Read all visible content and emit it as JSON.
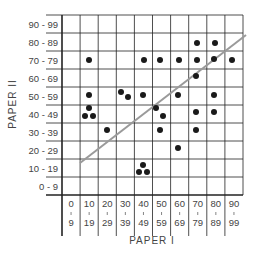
{
  "chart_data": {
    "type": "scatter",
    "title": "",
    "xlabel": "PAPER I",
    "ylabel": "PAPER II",
    "x_categories": [
      "0-9",
      "10-19",
      "20-29",
      "30-39",
      "40-49",
      "50-59",
      "60-69",
      "70-79",
      "80-89",
      "90-99"
    ],
    "x_tick_labels": [
      {
        "top": "0",
        "bottom": "9"
      },
      {
        "top": "10",
        "bottom": "19"
      },
      {
        "top": "20",
        "bottom": "29"
      },
      {
        "top": "30",
        "bottom": "39"
      },
      {
        "top": "40",
        "bottom": "49"
      },
      {
        "top": "50",
        "bottom": "59"
      },
      {
        "top": "60",
        "bottom": "69"
      },
      {
        "top": "70",
        "bottom": "79"
      },
      {
        "top": "80",
        "bottom": "89"
      },
      {
        "top": "90",
        "bottom": "99"
      }
    ],
    "y_categories": [
      "0 - 9",
      "10 - 19",
      "20 - 29",
      "30 - 39",
      "40 - 49",
      "50 - 59",
      "60 - 69",
      "70 - 79",
      "80 - 89",
      "90 - 99"
    ],
    "grid": true,
    "legend": "none",
    "points": [
      {
        "paper_I": "10-19",
        "paper_II": "70-79",
        "px": 89,
        "py": 60
      },
      {
        "paper_I": "10-19",
        "paper_II": "50-59",
        "px": 89,
        "py": 95
      },
      {
        "paper_I": "10-19",
        "paper_II": "40-49",
        "px": 89,
        "py": 108
      },
      {
        "paper_I": "10-19",
        "paper_II": "40-49",
        "px": 85,
        "py": 116
      },
      {
        "paper_I": "10-19",
        "paper_II": "40-49",
        "px": 93,
        "py": 116
      },
      {
        "paper_I": "20-29",
        "paper_II": "30-39",
        "px": 107,
        "py": 130
      },
      {
        "paper_I": "30-39",
        "paper_II": "50-59",
        "px": 121,
        "py": 92
      },
      {
        "paper_I": "30-39",
        "paper_II": "50-59",
        "px": 128,
        "py": 97
      },
      {
        "paper_I": "40-49",
        "paper_II": "70-79",
        "px": 144,
        "py": 60
      },
      {
        "paper_I": "40-49",
        "paper_II": "50-59",
        "px": 143,
        "py": 95
      },
      {
        "paper_I": "40-49",
        "paper_II": "10-19",
        "px": 143,
        "py": 165
      },
      {
        "paper_I": "40-49",
        "paper_II": "10-19",
        "px": 139,
        "py": 172
      },
      {
        "paper_I": "40-49",
        "paper_II": "10-19",
        "px": 147,
        "py": 172
      },
      {
        "paper_I": "50-59",
        "paper_II": "70-79",
        "px": 160,
        "py": 60
      },
      {
        "paper_I": "50-59",
        "paper_II": "40-49",
        "px": 156,
        "py": 108
      },
      {
        "paper_I": "50-59",
        "paper_II": "40-49",
        "px": 163,
        "py": 116
      },
      {
        "paper_I": "50-59",
        "paper_II": "30-39",
        "px": 160,
        "py": 130
      },
      {
        "paper_I": "60-69",
        "paper_II": "70-79",
        "px": 179,
        "py": 60
      },
      {
        "paper_I": "60-69",
        "paper_II": "50-59",
        "px": 178,
        "py": 95
      },
      {
        "paper_I": "60-69",
        "paper_II": "20-29",
        "px": 178,
        "py": 148
      },
      {
        "paper_I": "70-79",
        "paper_II": "80-89",
        "px": 197,
        "py": 43
      },
      {
        "paper_I": "70-79",
        "paper_II": "70-79",
        "px": 197,
        "py": 60
      },
      {
        "paper_I": "70-79",
        "paper_II": "60-69",
        "px": 196,
        "py": 76
      },
      {
        "paper_I": "70-79",
        "paper_II": "40-49",
        "px": 196,
        "py": 112
      },
      {
        "paper_I": "70-79",
        "paper_II": "30-39",
        "px": 196,
        "py": 130
      },
      {
        "paper_I": "80-89",
        "paper_II": "80-89",
        "px": 215,
        "py": 43
      },
      {
        "paper_I": "80-89",
        "paper_II": "70-79",
        "px": 214,
        "py": 59
      },
      {
        "paper_I": "80-89",
        "paper_II": "50-59",
        "px": 214,
        "py": 95
      },
      {
        "paper_I": "80-89",
        "paper_II": "40-49",
        "px": 214,
        "py": 112
      },
      {
        "paper_I": "90-99",
        "paper_II": "70-79",
        "px": 232,
        "py": 60
      }
    ],
    "trend_line": {
      "x1": 80,
      "y1": 163,
      "x2": 246,
      "y2": 35,
      "color": "#9a9a9a"
    },
    "colors": {
      "grid": "#222222",
      "points": "#1a1a1a",
      "text": "#444444"
    }
  }
}
